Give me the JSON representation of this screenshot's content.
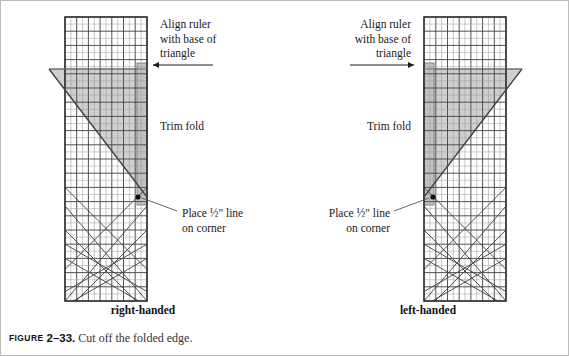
{
  "figure": {
    "caption_label": "Figure",
    "caption_number": "2–33.",
    "caption_text": "Cut off the folded edge.",
    "width": 569,
    "height": 356
  },
  "colors": {
    "ruler_line": "#4a4a4a",
    "ruler_minor_line": "#8c8c8c",
    "triangle_fill": "#cfcfcf",
    "fold_fill": "#c4c4c4",
    "outline": "#333333",
    "frame": "#bdbdbd",
    "text": "#1a1a1a",
    "caption_text": "#333333"
  },
  "panels": [
    {
      "id": "right-handed",
      "hand_label": "right-handed",
      "callouts": [
        {
          "name": "align-ruler",
          "text": "Align ruler\nwith base of\ntriangle",
          "align": "left",
          "x": 159,
          "y": 16,
          "arrow": {
            "direction": "left",
            "from_x": 212,
            "from_y": 64,
            "to_x": 152,
            "to_y": 64
          }
        },
        {
          "name": "trim-fold",
          "text": "Trim fold",
          "align": "left",
          "x": 159,
          "y": 118,
          "arrow": null
        },
        {
          "name": "place-half-inch-line",
          "text": "Place ½\" line\non corner",
          "align": "left",
          "x": 181,
          "y": 206,
          "arrow": {
            "direction": "leader-up-left",
            "from_x": 176,
            "from_y": 210,
            "to_x": 138,
            "to_y": 196
          }
        }
      ]
    },
    {
      "id": "left-handed",
      "hand_label": "left-handed",
      "callouts": [
        {
          "name": "align-ruler",
          "text": "Align ruler\nwith base of\ntriangle",
          "align": "right",
          "x": 20,
          "y": 16,
          "arrow": {
            "direction": "right",
            "from_x": 64,
            "from_y": 64,
            "to_x": 128,
            "to_y": 64
          }
        },
        {
          "name": "trim-fold",
          "text": "Trim fold",
          "align": "right",
          "x": 20,
          "y": 118,
          "arrow": null
        },
        {
          "name": "place-half-inch-line",
          "text": "Place ½\" line\non corner",
          "align": "right",
          "x": 14,
          "y": 206,
          "arrow": {
            "direction": "leader-up-right",
            "from_x": 108,
            "from_y": 210,
            "to_x": 144,
            "to_y": 196
          }
        }
      ]
    }
  ],
  "ruler": {
    "description": "quilting ruler with grid and 45-degree guide lines",
    "grid_columns": 7,
    "grid_rows": 20,
    "left_x": 64,
    "right_x": 146,
    "top_y": 16,
    "bottom_y": 300
  },
  "triangle": {
    "description": "shaded half-square triangle placed under the ruler",
    "apex_note": "base aligned with ruler edge"
  },
  "fold_strip": {
    "description": "narrow shaded strip marking the folded edge to be trimmed",
    "width_px": 10
  }
}
